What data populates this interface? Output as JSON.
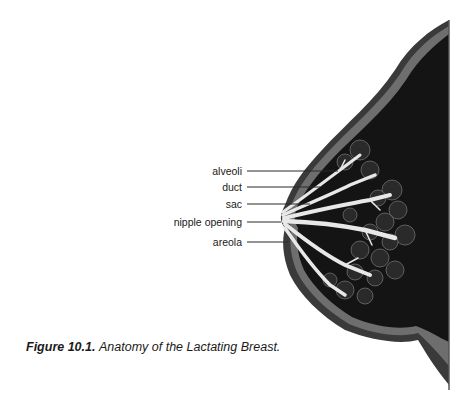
{
  "figure": {
    "caption_number": "Figure 10.1.",
    "caption_text": "Anatomy of the Lactating Breast."
  },
  "labels": [
    {
      "id": "alveoli",
      "text": "alveoli"
    },
    {
      "id": "duct",
      "text": "duct"
    },
    {
      "id": "sac",
      "text": "sac"
    },
    {
      "id": "nipple-opening",
      "text": "nipple opening"
    },
    {
      "id": "areola",
      "text": "areola"
    }
  ],
  "colors": {
    "tissue": "#141414",
    "skin": "#3a3a3a",
    "fat_layer": "#6e6e6e",
    "ducts": "#e8e8e8",
    "lobules": "#2a2a2a",
    "leader_line": "#2a2a2a"
  }
}
